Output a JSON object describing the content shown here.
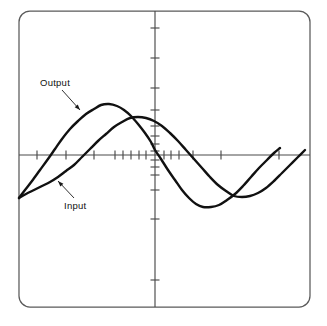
{
  "figure": {
    "title": "",
    "background_color": "#ffffff",
    "frame": {
      "name": "plot-border",
      "x": 19,
      "y": 11,
      "width": 291,
      "height": 296,
      "corner_radius": 11,
      "stroke_color": "#5a5a5a"
    }
  },
  "annotations": [
    {
      "id": "output",
      "label": "Output",
      "text_x": 40,
      "text_y": 86,
      "leader_from_x": 62,
      "leader_from_y": 90,
      "leader_to_x": 80,
      "leader_to_y": 110,
      "points_to": "output-curve"
    },
    {
      "id": "input",
      "label": "Input",
      "text_x": 64,
      "text_y": 209,
      "leader_from_x": 74,
      "leader_from_y": 198,
      "leader_to_x": 58,
      "leader_to_y": 181,
      "points_to": "input-curve"
    }
  ],
  "chart_data": {
    "type": "line",
    "title": "",
    "subtitle": "",
    "xlabel": "",
    "ylabel": "",
    "grid": false,
    "legend_position": "inline-annotations",
    "axes": {
      "x_axis": {
        "name": "horizontal-axis",
        "y_pixel": 155,
        "x_start_pixel": 19,
        "x_end_pixel": 310,
        "scale": "logarithmic-compressed-toward-origin",
        "origin_pixel": 155,
        "tick_pixels": [
          37,
          66,
          94,
          115,
          123,
          131,
          139,
          146,
          164,
          171,
          179,
          193,
          221,
          279
        ],
        "tick_length": 9
      },
      "y_axis": {
        "name": "vertical-axis",
        "x_pixel": 155,
        "y_start_pixel": 11,
        "y_end_pixel": 307,
        "scale": "logarithmic-compressed-toward-origin",
        "origin_pixel": 155,
        "tick_pixels": [
          28,
          58,
          88,
          110,
          126,
          136,
          144,
          151,
          160,
          167,
          175,
          190,
          219,
          280
        ],
        "tick_length": 9
      }
    },
    "series": [
      {
        "name": "Output",
        "color": "#111111",
        "line_width": 2.4,
        "phase": "leading",
        "description": "phase-advanced sinusoid, peaks earlier and at larger amplitude",
        "peak_pixel": {
          "x": 105,
          "y": 104
        },
        "trough_pixel": {
          "x": 206,
          "y": 207
        },
        "zero_crossings_pixels": [
          29,
          155,
          276
        ],
        "points": [
          [
            19,
            198
          ],
          [
            25,
            190
          ],
          [
            32,
            181
          ],
          [
            40,
            170
          ],
          [
            48,
            159
          ],
          [
            55,
            149
          ],
          [
            62,
            139
          ],
          [
            70,
            129
          ],
          [
            78,
            121
          ],
          [
            86,
            114
          ],
          [
            94,
            109
          ],
          [
            101,
            105
          ],
          [
            109,
            104
          ],
          [
            117,
            106
          ],
          [
            124,
            110
          ],
          [
            131,
            116
          ],
          [
            138,
            124
          ],
          [
            145,
            133
          ],
          [
            151,
            142
          ],
          [
            155,
            150
          ],
          [
            161,
            159
          ],
          [
            168,
            170
          ],
          [
            175,
            180
          ],
          [
            182,
            190
          ],
          [
            189,
            198
          ],
          [
            196,
            204
          ],
          [
            203,
            207
          ],
          [
            211,
            207
          ],
          [
            219,
            205
          ],
          [
            227,
            200
          ],
          [
            235,
            194
          ],
          [
            243,
            186
          ],
          [
            251,
            177
          ],
          [
            259,
            168
          ],
          [
            267,
            160
          ],
          [
            274,
            153
          ],
          [
            280,
            148
          ]
        ]
      },
      {
        "name": "Input",
        "color": "#111111",
        "line_width": 2.4,
        "phase": "reference",
        "description": "reference sinusoid, peaks later and at smaller amplitude",
        "peak_pixel": {
          "x": 132,
          "y": 117
        },
        "trough_pixel": {
          "x": 238,
          "y": 197
        },
        "zero_crossings_pixels": [
          57,
          180,
          300
        ],
        "points": [
          [
            19,
            198
          ],
          [
            26,
            194
          ],
          [
            34,
            190
          ],
          [
            42,
            186
          ],
          [
            50,
            182
          ],
          [
            58,
            177
          ],
          [
            66,
            171
          ],
          [
            74,
            165
          ],
          [
            82,
            157
          ],
          [
            90,
            149
          ],
          [
            98,
            141
          ],
          [
            106,
            134
          ],
          [
            114,
            127
          ],
          [
            122,
            122
          ],
          [
            130,
            118
          ],
          [
            138,
            117
          ],
          [
            146,
            118
          ],
          [
            154,
            121
          ],
          [
            162,
            126
          ],
          [
            170,
            133
          ],
          [
            178,
            141
          ],
          [
            186,
            150
          ],
          [
            194,
            159
          ],
          [
            202,
            168
          ],
          [
            210,
            177
          ],
          [
            218,
            185
          ],
          [
            226,
            191
          ],
          [
            234,
            196
          ],
          [
            242,
            197
          ],
          [
            250,
            196
          ],
          [
            258,
            193
          ],
          [
            266,
            188
          ],
          [
            274,
            181
          ],
          [
            282,
            173
          ],
          [
            290,
            165
          ],
          [
            298,
            157
          ],
          [
            305,
            150
          ]
        ]
      }
    ]
  }
}
